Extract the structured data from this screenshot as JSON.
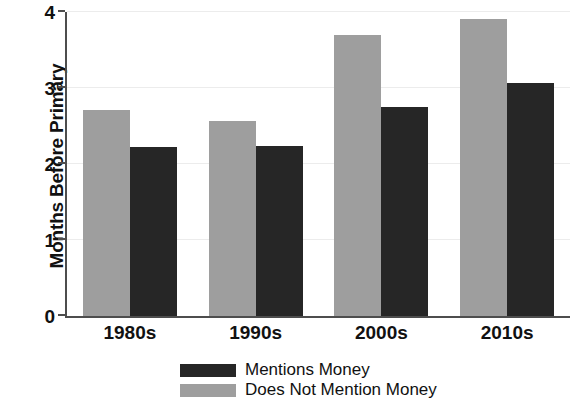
{
  "chart_data": {
    "type": "bar",
    "title": "",
    "subtitle": "",
    "xlabel": "",
    "ylabel": "Months Before Primary",
    "categories": [
      "1980s",
      "1990s",
      "2000s",
      "2010s"
    ],
    "series": [
      {
        "name": "Does Not Mention Money",
        "color": "#9e9e9e",
        "values": [
          2.71,
          2.56,
          3.7,
          3.91
        ]
      },
      {
        "name": "Mentions Money",
        "color": "#262626",
        "values": [
          2.22,
          2.24,
          2.75,
          3.06
        ]
      }
    ],
    "ylim": [
      0,
      4
    ],
    "yticks": [
      0,
      1,
      2,
      3,
      4
    ],
    "ytick_labels": [
      "0",
      "1",
      "2",
      "3",
      "4"
    ],
    "grid": true,
    "grid_axis": "y",
    "legend_position": "bottom",
    "legend_order": [
      "Mentions Money",
      "Does Not Mention Money"
    ],
    "bar_order_in_group": [
      "Does Not Mention Money",
      "Mentions Money"
    ]
  },
  "legend": {
    "entries": [
      {
        "label": "Mentions Money",
        "swatch": "dark-swatch"
      },
      {
        "label": "Does Not Mention Money",
        "swatch": "light-swatch"
      }
    ]
  },
  "axes": {
    "y_title": "Months Before Primary",
    "y_tick_labels": [
      "0",
      "1",
      "2",
      "3",
      "4"
    ],
    "x_tick_labels": [
      "1980s",
      "1990s",
      "2000s",
      "2010s"
    ]
  }
}
